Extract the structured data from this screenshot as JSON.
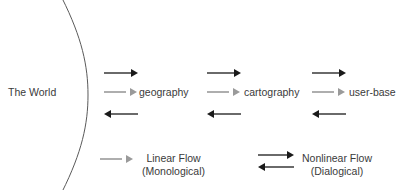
{
  "diagram": {
    "title_visible": false,
    "background_color": "#ffffff",
    "boundary_arc": {
      "name": "world-boundary-arc",
      "color": "#5a5a5a",
      "stroke_width": 1
    },
    "nodes": [
      {
        "id": "world",
        "label": "The World",
        "x": 8,
        "y": 86
      },
      {
        "id": "geography",
        "label": "geography",
        "x": 139,
        "y": 86
      },
      {
        "id": "cartography",
        "label": "cartography",
        "x": 244,
        "y": 86
      },
      {
        "id": "user-base",
        "label": "user-base",
        "x": 349,
        "y": 86
      }
    ],
    "flow_groups": [
      {
        "id": "world-to-geography",
        "x": 104,
        "arrows": [
          {
            "type": "nonlinear-forward",
            "direction": "right",
            "color": "#1a1a1a",
            "y": 73
          },
          {
            "type": "linear-forward",
            "direction": "right",
            "color": "#9a9a9a",
            "y": 92
          },
          {
            "type": "nonlinear-back",
            "direction": "left",
            "color": "#1a1a1a",
            "y": 114
          }
        ]
      },
      {
        "id": "geography-to-cartography",
        "x": 207,
        "arrows": [
          {
            "type": "nonlinear-forward",
            "direction": "right",
            "color": "#1a1a1a",
            "y": 73
          },
          {
            "type": "linear-forward",
            "direction": "right",
            "color": "#9a9a9a",
            "y": 92
          },
          {
            "type": "nonlinear-back",
            "direction": "left",
            "color": "#1a1a1a",
            "y": 114
          }
        ]
      },
      {
        "id": "cartography-to-user-base",
        "x": 312,
        "arrows": [
          {
            "type": "nonlinear-forward",
            "direction": "right",
            "color": "#1a1a1a",
            "y": 73
          },
          {
            "type": "linear-forward",
            "direction": "right",
            "color": "#9a9a9a",
            "y": 92
          },
          {
            "type": "nonlinear-back",
            "direction": "left",
            "color": "#1a1a1a",
            "y": 114
          }
        ]
      }
    ]
  },
  "legend": {
    "items": [
      {
        "id": "linear-flow",
        "line1": "Linear Flow",
        "line2": "(Monological)",
        "color": "#9a9a9a",
        "arrow_style": "single-right",
        "swatch_x": 100,
        "text_x": 142,
        "text_y": 152
      },
      {
        "id": "nonlinear-flow",
        "line1": "Nonlinear Flow",
        "line2": "(Dialogical)",
        "color": "#1a1a1a",
        "arrow_style": "double-bidirectional",
        "swatch_x": 258,
        "text_x": 302,
        "text_y": 152
      }
    ]
  }
}
